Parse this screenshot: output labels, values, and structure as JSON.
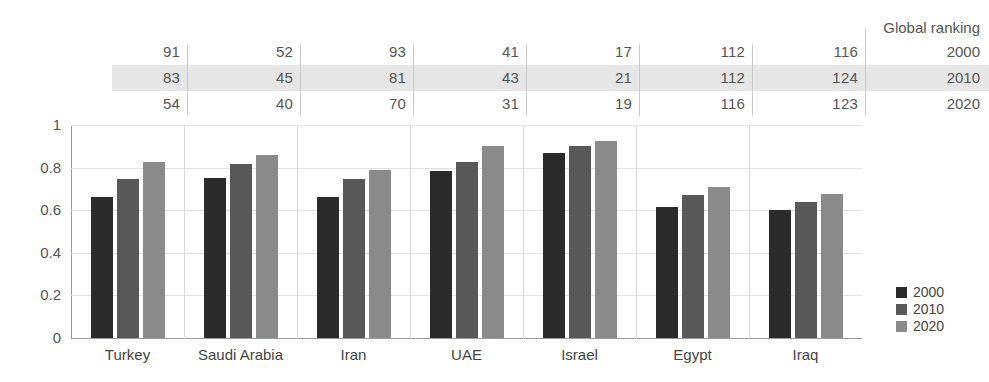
{
  "ranking_table": {
    "title": "Global ranking",
    "row_labels": [
      "2000",
      "2010",
      "2020"
    ],
    "columns": [
      "Turkey",
      "Saudi Arabia",
      "Iran",
      "UAE",
      "Israel",
      "Egypt",
      "Iraq"
    ],
    "rows": [
      [
        "91",
        "52",
        "93",
        "41",
        "17",
        "112",
        "116"
      ],
      [
        "83",
        "45",
        "81",
        "43",
        "21",
        "112",
        "124"
      ],
      [
        "54",
        "40",
        "70",
        "31",
        "19",
        "116",
        "123"
      ]
    ],
    "highlighted_row_index": 1
  },
  "legend": {
    "position": "right",
    "items": [
      {
        "label": "2000",
        "color": "#2b2b2b"
      },
      {
        "label": "2010",
        "color": "#585858"
      },
      {
        "label": "2020",
        "color": "#8a8a8a"
      }
    ]
  },
  "axis": {
    "y_ticks": [
      "1",
      "0.8",
      "0.6",
      "0.4",
      "0.2",
      "0"
    ],
    "y_tick_values": [
      1,
      0.8,
      0.6,
      0.4,
      0.2,
      0
    ]
  },
  "chart_data": {
    "type": "bar",
    "title": "",
    "subtitle": "",
    "xlabel": "",
    "ylabel": "",
    "ylim": [
      0,
      1
    ],
    "grid": true,
    "legend_position": "right",
    "categories": [
      "Turkey",
      "Saudi Arabia",
      "Iran",
      "UAE",
      "Israel",
      "Egypt",
      "Iraq"
    ],
    "series": [
      {
        "name": "2000",
        "color": "#2b2b2b",
        "values": [
          0.66,
          0.75,
          0.66,
          0.785,
          0.87,
          0.615,
          0.6
        ]
      },
      {
        "name": "2010",
        "color": "#585858",
        "values": [
          0.745,
          0.815,
          0.745,
          0.825,
          0.9,
          0.67,
          0.64
        ]
      },
      {
        "name": "2020",
        "color": "#8a8a8a",
        "values": [
          0.825,
          0.86,
          0.79,
          0.9,
          0.925,
          0.71,
          0.675
        ]
      }
    ],
    "annotations": {
      "global_ranking_title": "Global ranking",
      "global_ranking": {
        "2000": [
          91,
          52,
          93,
          41,
          17,
          112,
          116
        ],
        "2010": [
          83,
          45,
          81,
          43,
          21,
          112,
          124
        ],
        "2020": [
          54,
          40,
          70,
          31,
          19,
          116,
          123
        ]
      }
    }
  }
}
